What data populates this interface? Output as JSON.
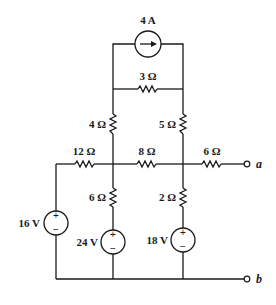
{
  "circuit": {
    "current_source": {
      "label": "4 A",
      "direction": "right"
    },
    "resistors": {
      "r_top": "3 Ω",
      "r_left_upper": "4 Ω",
      "r_right_upper": "5 Ω",
      "r_left_horizontal": "12 Ω",
      "r_middle_horizontal": "8 Ω",
      "r_right_horizontal": "6 Ω",
      "r_center_lower": "6 Ω",
      "r_right_lower": "2 Ω"
    },
    "voltage_sources": {
      "v_left": {
        "label": "16 V",
        "plus": "+",
        "minus": "−"
      },
      "v_center": {
        "label": "24 V",
        "plus": "+",
        "minus": "−"
      },
      "v_right": {
        "label": "18 V",
        "plus": "+",
        "minus": "−"
      }
    },
    "terminals": {
      "a": "a",
      "b": "b"
    },
    "colors": {
      "line": "#1a1a1a",
      "background": "#ffffff"
    }
  }
}
